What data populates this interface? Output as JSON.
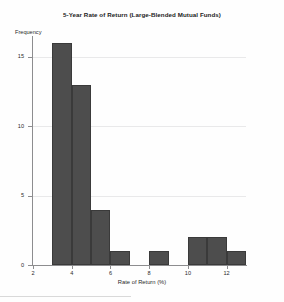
{
  "chart_data": {
    "type": "bar",
    "title": "5-Year Rate of Return (Large-Blended Mutual Funds)",
    "xlabel": "Rate of Return (%)",
    "ylabel": "Frequency",
    "bin_width": 1,
    "bin_edges": [
      2,
      3,
      4,
      5,
      6,
      7,
      8,
      9,
      10,
      11,
      12,
      13
    ],
    "categories": [
      "2-3",
      "3-4",
      "4-5",
      "5-6",
      "6-7",
      "7-8",
      "8-9",
      "9-10",
      "10-11",
      "11-12",
      "12-13"
    ],
    "values": [
      0,
      16,
      13,
      4,
      1,
      0,
      1,
      0,
      2,
      2,
      1
    ],
    "x": [
      2,
      3,
      4,
      5,
      6,
      7,
      8,
      9,
      10,
      11,
      12
    ],
    "xlim": [
      2,
      13
    ],
    "ylim": [
      0,
      16.5
    ],
    "xticks": [
      2,
      4,
      6,
      8,
      10,
      12
    ],
    "yticks": [
      0,
      5,
      10,
      15
    ],
    "xtick_labels": [
      "2",
      "4",
      "6",
      "8",
      "10",
      "12"
    ],
    "ytick_labels": [
      "0",
      "5",
      "10",
      "15"
    ],
    "grid": true,
    "legend": false,
    "bar_color": "#4d4d4d",
    "grid_color": "#e9e9ea",
    "axis_color": "#8d8d8f",
    "background": "#fefefe"
  }
}
